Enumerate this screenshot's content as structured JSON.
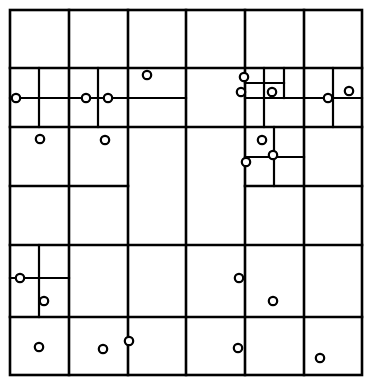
{
  "figure": {
    "title": "",
    "caption": "",
    "type": "adaptive-grid-subdivision",
    "background_color": "#ffffff",
    "line_color": "#000000",
    "point_fill_color": "#ffffff",
    "point_stroke_color": "#000000"
  },
  "geometry": {
    "viewbox": {
      "x": 0,
      "y": 0,
      "width": 374,
      "height": 385
    },
    "border": {
      "x": 10,
      "y": 10,
      "width": 352,
      "height": 365,
      "stroke_width": 2.6
    },
    "line_width_major": 2.6,
    "line_width_minor": 2.0,
    "point_radius": 4.2,
    "point_stroke_width": 2.2
  },
  "grid": {
    "outer_columns": [
      10,
      69,
      128,
      186,
      245,
      304,
      362
    ],
    "outer_rows": [
      10,
      68,
      127,
      186,
      245,
      317,
      375
    ],
    "segments": [
      {
        "id": "v-col1",
        "x1": 69,
        "y1": 10,
        "x2": 69,
        "y2": 375,
        "orient": "vertical",
        "w": 2.6
      },
      {
        "id": "v-col2",
        "x1": 128,
        "y1": 10,
        "x2": 128,
        "y2": 375,
        "orient": "vertical",
        "w": 2.6
      },
      {
        "id": "v-col3",
        "x1": 186,
        "y1": 10,
        "x2": 186,
        "y2": 375,
        "orient": "vertical",
        "w": 2.6
      },
      {
        "id": "v-col4",
        "x1": 245,
        "y1": 10,
        "x2": 245,
        "y2": 375,
        "orient": "vertical",
        "w": 2.6
      },
      {
        "id": "v-col5",
        "x1": 304,
        "y1": 10,
        "x2": 304,
        "y2": 375,
        "orient": "vertical",
        "w": 2.6
      },
      {
        "id": "h-row1",
        "x1": 10,
        "y1": 68,
        "x2": 362,
        "y2": 68,
        "orient": "horizontal",
        "w": 2.6
      },
      {
        "id": "h-row2-left",
        "x1": 10,
        "y1": 127,
        "x2": 245,
        "y2": 127,
        "orient": "horizontal",
        "w": 2.6
      },
      {
        "id": "h-row2-right",
        "x1": 245,
        "y1": 127,
        "x2": 362,
        "y2": 127,
        "orient": "horizontal",
        "w": 2.6
      },
      {
        "id": "h-row3-left",
        "x1": 10,
        "y1": 186,
        "x2": 128,
        "y2": 186,
        "orient": "horizontal",
        "w": 2.6
      },
      {
        "id": "h-row3-right",
        "x1": 245,
        "y1": 186,
        "x2": 362,
        "y2": 186,
        "orient": "horizontal",
        "w": 2.6
      },
      {
        "id": "h-row4",
        "x1": 10,
        "y1": 245,
        "x2": 362,
        "y2": 245,
        "orient": "horizontal",
        "w": 2.6
      },
      {
        "id": "h-row5",
        "x1": 10,
        "y1": 317,
        "x2": 362,
        "y2": 317,
        "orient": "horizontal",
        "w": 2.6
      },
      {
        "id": "v-sub-a",
        "x1": 39,
        "y1": 68,
        "x2": 39,
        "y2": 127,
        "orient": "vertical",
        "w": 2.2
      },
      {
        "id": "h-sub-a",
        "x1": 10,
        "y1": 98,
        "x2": 186,
        "y2": 98,
        "orient": "horizontal",
        "w": 2.2
      },
      {
        "id": "v-sub-b",
        "x1": 98,
        "y1": 68,
        "x2": 98,
        "y2": 127,
        "orient": "vertical",
        "w": 2.2
      },
      {
        "id": "v-sub-c",
        "x1": 264,
        "y1": 68,
        "x2": 264,
        "y2": 127,
        "orient": "vertical",
        "w": 2.2
      },
      {
        "id": "h-sub-c",
        "x1": 245,
        "y1": 83,
        "x2": 284,
        "y2": 83,
        "orient": "horizontal",
        "w": 2.2
      },
      {
        "id": "v-sub-d",
        "x1": 284,
        "y1": 68,
        "x2": 284,
        "y2": 98,
        "orient": "vertical",
        "w": 2.2
      },
      {
        "id": "h-sub-d",
        "x1": 245,
        "y1": 98,
        "x2": 362,
        "y2": 98,
        "orient": "horizontal",
        "w": 2.2
      },
      {
        "id": "v-sub-e",
        "x1": 333,
        "y1": 68,
        "x2": 333,
        "y2": 127,
        "orient": "vertical",
        "w": 2.2
      },
      {
        "id": "v-sub-f",
        "x1": 274,
        "y1": 127,
        "x2": 274,
        "y2": 186,
        "orient": "vertical",
        "w": 2.2
      },
      {
        "id": "h-sub-f",
        "x1": 245,
        "y1": 157,
        "x2": 304,
        "y2": 157,
        "orient": "horizontal",
        "w": 2.2
      },
      {
        "id": "v-sub-g",
        "x1": 39,
        "y1": 245,
        "x2": 39,
        "y2": 317,
        "orient": "vertical",
        "w": 2.2
      },
      {
        "id": "h-sub-g",
        "x1": 10,
        "y1": 278,
        "x2": 69,
        "y2": 278,
        "orient": "horizontal",
        "w": 2.2
      }
    ]
  },
  "points": [
    {
      "id": "p01",
      "x": 16,
      "y": 98
    },
    {
      "id": "p02",
      "x": 86,
      "y": 98
    },
    {
      "id": "p03",
      "x": 108,
      "y": 98
    },
    {
      "id": "p04",
      "x": 147,
      "y": 75
    },
    {
      "id": "p05",
      "x": 244,
      "y": 77
    },
    {
      "id": "p06",
      "x": 241,
      "y": 92
    },
    {
      "id": "p07",
      "x": 272,
      "y": 92
    },
    {
      "id": "p08",
      "x": 328,
      "y": 98
    },
    {
      "id": "p09",
      "x": 349,
      "y": 91
    },
    {
      "id": "p10",
      "x": 40,
      "y": 139
    },
    {
      "id": "p11",
      "x": 105,
      "y": 140
    },
    {
      "id": "p12",
      "x": 262,
      "y": 140
    },
    {
      "id": "p13",
      "x": 273,
      "y": 155
    },
    {
      "id": "p14",
      "x": 246,
      "y": 162
    },
    {
      "id": "p15",
      "x": 20,
      "y": 278
    },
    {
      "id": "p16",
      "x": 44,
      "y": 301
    },
    {
      "id": "p17",
      "x": 239,
      "y": 278
    },
    {
      "id": "p18",
      "x": 273,
      "y": 301
    },
    {
      "id": "p19",
      "x": 39,
      "y": 347
    },
    {
      "id": "p20",
      "x": 103,
      "y": 349
    },
    {
      "id": "p21",
      "x": 129,
      "y": 341
    },
    {
      "id": "p22",
      "x": 238,
      "y": 348
    },
    {
      "id": "p23",
      "x": 320,
      "y": 358
    }
  ]
}
